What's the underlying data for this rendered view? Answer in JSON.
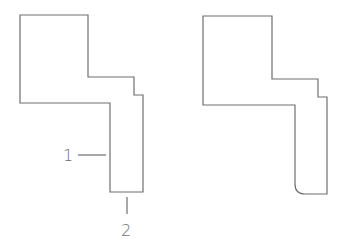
{
  "figures": [
    {
      "name": "profile-sharp-corner",
      "labels": [
        {
          "id": "1",
          "text": "1"
        },
        {
          "id": "2",
          "text": "2"
        }
      ]
    },
    {
      "name": "profile-rounded-corner",
      "labels": []
    }
  ],
  "colors": {
    "stroke": "#6e6e6e",
    "background": "#ffffff"
  }
}
